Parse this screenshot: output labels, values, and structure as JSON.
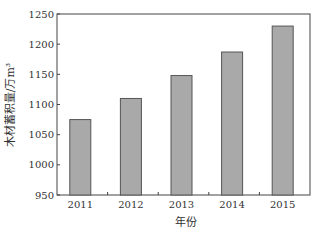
{
  "chart_data": {
    "type": "bar",
    "title": "",
    "xlabel": "年份",
    "ylabel": "木材蓄积量/万m³",
    "categories": [
      "2011",
      "2012",
      "2013",
      "2014",
      "2015"
    ],
    "values": [
      1075,
      1110,
      1148,
      1187,
      1230
    ],
    "ylim": [
      950,
      1250
    ],
    "yticks": [
      950,
      1000,
      1050,
      1100,
      1150,
      1200,
      1250
    ],
    "grid": false,
    "legend": null,
    "bar_color": "#a9a9a9",
    "bar_edge_color": "#555555"
  }
}
